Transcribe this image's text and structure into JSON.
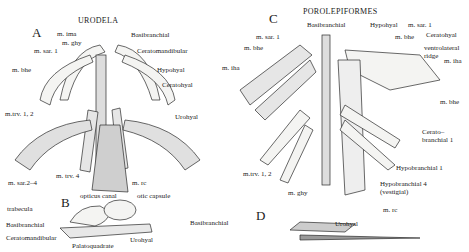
{
  "figure": {
    "panels": {
      "A": {
        "letter": "A",
        "title": "URODELA"
      },
      "B": {
        "letter": "B"
      },
      "C": {
        "letter": "C",
        "title": "POROLEPIFORMES"
      },
      "D": {
        "letter": "D"
      }
    },
    "labels_A": {
      "m_ima": "m. ima",
      "m_ghy": "m. ghy",
      "m_sar1": "m. sar. 1",
      "m_bhe": "m. bhe",
      "basibranchial": "Basibranchial",
      "ceratomandibular": "Ceratomandibular",
      "hypohyal": "Hypohyal",
      "ceratohyal": "Ceratohyal",
      "m_trv12": "m.trv. 1, 2",
      "urohyal": "Urohyal",
      "m_sar24": "m. sar.2–4",
      "m_trv4": "m. trv. 4",
      "m_rc": "m. rc"
    },
    "labels_B": {
      "opticus_canal": "opticus canal",
      "otic_capsule": "otic capsule",
      "trabecula": "trabecula",
      "basibranchial": "Basibranchial",
      "ceratomandibular": "Ceratomandibular",
      "palatoquadrate": "Palatoquadrate",
      "urohyal": "Urohyal"
    },
    "labels_C": {
      "basibranchial": "Basibranchial",
      "hypohyal": "Hypohyal",
      "m_sar1_right": "m. sar. 1",
      "m_sar1_left": "m. sar. 1",
      "m_bhe_left": "m. bhe",
      "m_bhe_right": "m. bhe",
      "ceratohyal": "Ceratohyal",
      "ventrolateral_ridge_1": "ventrolateral",
      "ventrolateral_ridge_2": "ridge",
      "m_iha_left": "m. iha",
      "m_iha_right": "m. iha",
      "m_bhe_lower": "m. bhe",
      "ceratobranchial_1a": "Cerato–",
      "ceratobranchial_1b": "branchial 1",
      "hypobranchial_1": "Hypobranchial 1",
      "hypobranchial_4a": "Hypobranchial 4",
      "hypobranchial_4b": "(vestigial)",
      "m_trv12": "m.trv. 1, 2",
      "m_ghy": "m. ghy",
      "m_rc": "m. rc"
    },
    "labels_D": {
      "basibranchial": "Basibranchial",
      "urohyal": "Urohyal"
    }
  }
}
